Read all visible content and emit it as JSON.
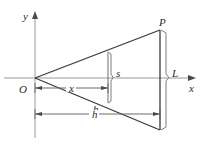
{
  "figure": {
    "background_color": "#ffffff",
    "line_color": "#3a3a3a",
    "axis_color": "#8a8a8a",
    "text_color": "#2b2b2b",
    "width": 203,
    "height": 151
  },
  "axes": {
    "x_axis": {
      "label": "x",
      "label_x": 189,
      "label_y": 92,
      "start_x": 4,
      "end_x": 196,
      "y": 78,
      "has_arrow": true
    },
    "y_axis": {
      "label": "y",
      "label_x": 23,
      "label_y": 20,
      "x": 35,
      "start_y": 138,
      "end_y": 11,
      "has_arrow": true
    },
    "origin": {
      "label": "O",
      "label_x": 19,
      "label_y": 93,
      "x": 35,
      "y": 78
    }
  },
  "shape": {
    "name": "triangle",
    "apex": {
      "x": 35,
      "y": 78
    },
    "top_vertex": {
      "x": 160,
      "y": 30
    },
    "bottom_vertex": {
      "x": 160,
      "y": 130
    }
  },
  "points": [
    {
      "label": "P",
      "label_x": 159,
      "label_y": 26,
      "x": 160,
      "y": 30
    }
  ],
  "measurements": [
    {
      "name": "L",
      "label": "L",
      "label_x": 172,
      "label_y": 77,
      "kind": "brace",
      "x": 167,
      "from_y": 30,
      "to_y": 130
    },
    {
      "name": "s",
      "label": "s",
      "label_x": 116,
      "label_y": 77,
      "kind": "brace",
      "x": 111,
      "from_y": 52,
      "to_y": 103,
      "line_x": 108
    },
    {
      "name": "x",
      "label": "x",
      "label_x": 70,
      "label_y": 88,
      "kind": "dimension",
      "y": 88,
      "from_x": 35,
      "to_x": 108
    },
    {
      "name": "h",
      "label": "h",
      "label_x": 93,
      "label_y": 114,
      "kind": "dimension",
      "y": 114,
      "from_x": 35,
      "to_x": 160
    }
  ]
}
